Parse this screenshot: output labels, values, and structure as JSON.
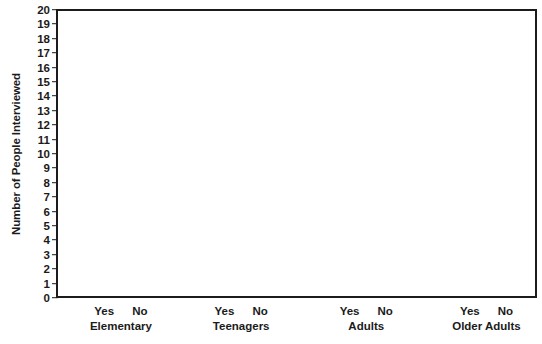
{
  "chart_data": {
    "type": "bar",
    "title": "",
    "subtitle": "",
    "xlabel": "",
    "ylabel": "Number of People Interviewed",
    "ylim": [
      0,
      20
    ],
    "ytick_labels": [
      "20",
      "19",
      "18",
      "17",
      "16",
      "15",
      "14",
      "13",
      "12",
      "11",
      "10",
      "9",
      "8",
      "7",
      "6",
      "5",
      "4",
      "3",
      "2",
      "1",
      "0"
    ],
    "ytick_values": [
      20,
      19,
      18,
      17,
      16,
      15,
      14,
      13,
      12,
      11,
      10,
      9,
      8,
      7,
      6,
      5,
      4,
      3,
      2,
      1,
      0
    ],
    "grid": false,
    "legend": false,
    "legend_position": "none",
    "categories": [
      "Elementary",
      "Teenagers",
      "Adults",
      "Older Adults"
    ],
    "sub_categories": [
      "Yes",
      "No"
    ],
    "series": [
      {
        "name": "Yes",
        "values": [
          null,
          null,
          null,
          null
        ]
      },
      {
        "name": "No",
        "values": [
          null,
          null,
          null,
          null
        ]
      }
    ],
    "annotations": [],
    "note": "blank chart template - no bars plotted"
  },
  "axes": {
    "y_title": "Number of People Interviewed",
    "y_ticks": [
      {
        "label": "20",
        "value": 20
      },
      {
        "label": "19",
        "value": 19
      },
      {
        "label": "18",
        "value": 18
      },
      {
        "label": "17",
        "value": 17
      },
      {
        "label": "16",
        "value": 16
      },
      {
        "label": "15",
        "value": 15
      },
      {
        "label": "14",
        "value": 14
      },
      {
        "label": "13",
        "value": 13
      },
      {
        "label": "12",
        "value": 12
      },
      {
        "label": "11",
        "value": 11
      },
      {
        "label": "10",
        "value": 10
      },
      {
        "label": "9",
        "value": 9
      },
      {
        "label": "8",
        "value": 8
      },
      {
        "label": "7",
        "value": 7
      },
      {
        "label": "6",
        "value": 6
      },
      {
        "label": "5",
        "value": 5
      },
      {
        "label": "4",
        "value": 4
      },
      {
        "label": "3",
        "value": 3
      },
      {
        "label": "2",
        "value": 2
      },
      {
        "label": "1",
        "value": 1
      },
      {
        "label": "0",
        "value": 0
      }
    ],
    "x_groups": [
      {
        "name": "Elementary",
        "center_pct": 13.5,
        "sub": [
          "Yes",
          "No"
        ]
      },
      {
        "name": "Teenagers",
        "center_pct": 38.5,
        "sub": [
          "Yes",
          "No"
        ]
      },
      {
        "name": "Adults",
        "center_pct": 64.5,
        "sub": [
          "Yes",
          "No"
        ]
      },
      {
        "name": "Older Adults",
        "center_pct": 89.5,
        "sub": [
          "Yes",
          "No"
        ]
      }
    ]
  },
  "colors": {
    "axis": "#1b1b1b",
    "text": "#1b1b1b",
    "background": "#ffffff",
    "plot_background": "#ffffff"
  }
}
